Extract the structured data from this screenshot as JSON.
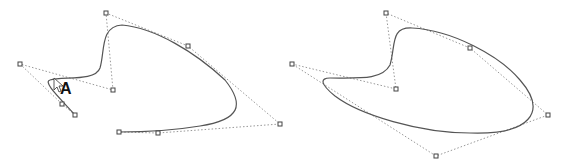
{
  "figures": [
    {
      "name": "open-spline",
      "label": "A",
      "control_points": [
        [
          75,
          115
        ],
        [
          62,
          104
        ],
        [
          20,
          64
        ],
        [
          113,
          90
        ],
        [
          106,
          13
        ],
        [
          188,
          46
        ],
        [
          280,
          124
        ],
        [
          158,
          133
        ],
        [
          119,
          132
        ]
      ],
      "curve_path": "M75,115 C60,100 40,80 55,80 C70,76 95,82 100,70 C105,55 100,25 120,25 C150,28 190,50 225,80 C245,105 240,118 200,125 C170,131 140,132 119,132"
    },
    {
      "name": "closed-spline",
      "control_points": [
        [
          292,
          64
        ],
        [
          396,
          89
        ],
        [
          386,
          13
        ],
        [
          470,
          48
        ],
        [
          548,
          115
        ],
        [
          436,
          156
        ]
      ],
      "curve_path": "M330,78 C360,78 380,80 390,65 C395,45 390,25 410,28 C450,30 500,55 520,80 C550,110 530,135 470,133 C420,133 360,115 335,95 C320,82 320,78 330,78 Z"
    }
  ],
  "annotation": {
    "text": "A"
  }
}
